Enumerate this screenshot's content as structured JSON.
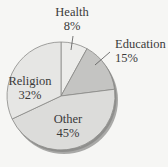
{
  "chart_data": {
    "type": "pie",
    "title": "",
    "categories": [
      "Health",
      "Education",
      "Other",
      "Religion"
    ],
    "values": [
      8,
      15,
      45,
      32
    ],
    "unit": "%",
    "start_angle": "12 o'clock",
    "direction": "clockwise",
    "colors": [
      "#ececea",
      "#c4c4c2",
      "#dcdcda",
      "#e6e6e4"
    ],
    "labels": [
      {
        "name": "Health",
        "pct": "8%"
      },
      {
        "name": "Education",
        "pct": "15%"
      },
      {
        "name": "Other",
        "pct": "45%"
      },
      {
        "name": "Religion",
        "pct": "32%"
      }
    ],
    "legend": "none",
    "style": "3D shadowed pie with leader lines for Health and Education"
  }
}
